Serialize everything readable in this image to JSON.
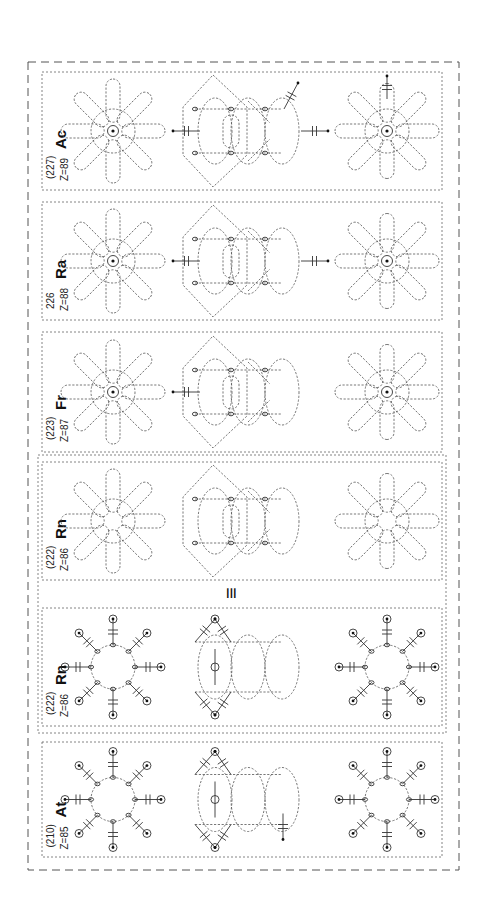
{
  "figure": {
    "orientation": "rotated-90-ccw",
    "identity_symbol": "≡",
    "panels": [
      {
        "id": "ac",
        "symbol": "Ac",
        "mass": "(227)",
        "z": "Z=89",
        "style": "cloud",
        "nucleus_marked": true,
        "arrows": [
          "left",
          "right",
          "diag-up",
          "top-right-shape"
        ]
      },
      {
        "id": "ra",
        "symbol": "Ra",
        "mass": "226",
        "z": "Z=88",
        "style": "cloud",
        "nucleus_marked": true,
        "arrows": [
          "left",
          "right"
        ]
      },
      {
        "id": "fr",
        "symbol": "Fr",
        "mass": "(223)",
        "z": "Z=87",
        "style": "cloud",
        "nucleus_marked": true,
        "arrows": [
          "left"
        ]
      },
      {
        "id": "rn-cloud",
        "symbol": "Rn",
        "mass": "(222)",
        "z": "Z=86",
        "style": "cloud",
        "nucleus_marked": false,
        "arrows": []
      },
      {
        "id": "rn-orbital",
        "symbol": "Rn",
        "mass": "(222)",
        "z": "Z=86",
        "style": "orbital",
        "nucleus_marked": false,
        "arrows": []
      },
      {
        "id": "at",
        "symbol": "At",
        "mass": "(210)",
        "z": "Z=85",
        "style": "orbital",
        "nucleus_marked": false,
        "arrows": [
          "down-middle",
          "diag-right"
        ]
      }
    ]
  }
}
